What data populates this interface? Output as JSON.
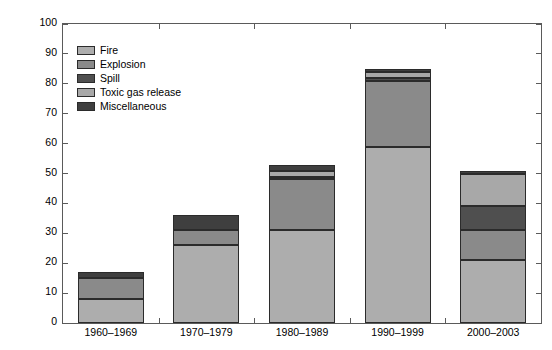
{
  "chart_data": {
    "type": "bar",
    "stacked": true,
    "title": "",
    "xlabel": "",
    "ylabel": "Number of accidents",
    "categories": [
      "1960–1969",
      "1970–1979",
      "1980–1989",
      "1990–1999",
      "2000–2003"
    ],
    "series": [
      {
        "name": "Fire",
        "color": "#adadad",
        "values": [
          8,
          26,
          31,
          59,
          21
        ]
      },
      {
        "name": "Explosion",
        "color": "#8a8a8a",
        "values": [
          7,
          5,
          17,
          22,
          10
        ]
      },
      {
        "name": "Spill",
        "color": "#4f4f4f",
        "values": [
          0,
          0,
          1,
          1,
          8
        ]
      },
      {
        "name": "Toxic gas release",
        "color": "#a8a8a8",
        "values": [
          0,
          0,
          2,
          2,
          11
        ]
      },
      {
        "name": "Miscellaneous",
        "color": "#3f3f3f",
        "values": [
          2,
          5,
          2,
          1,
          1
        ]
      }
    ],
    "totals": [
      17,
      36,
      53,
      85,
      51
    ],
    "ylim": [
      0,
      100
    ],
    "yticks": [
      0,
      10,
      20,
      30,
      40,
      50,
      60,
      70,
      80,
      90,
      100
    ],
    "ytick_labels": [
      "0",
      "10",
      "20",
      "30",
      "40",
      "50",
      "60",
      "70",
      "80",
      "90",
      "100"
    ],
    "grid": false,
    "legend_position": "upper left",
    "axis_color": "#5a5a5a",
    "bar_edge_color": "#2b2b2b",
    "background": "#ffffff"
  },
  "legend": {
    "items": [
      {
        "label": "Fire"
      },
      {
        "label": "Explosion"
      },
      {
        "label": "Spill"
      },
      {
        "label": "Toxic gas release"
      },
      {
        "label": "Miscellaneous"
      }
    ]
  }
}
